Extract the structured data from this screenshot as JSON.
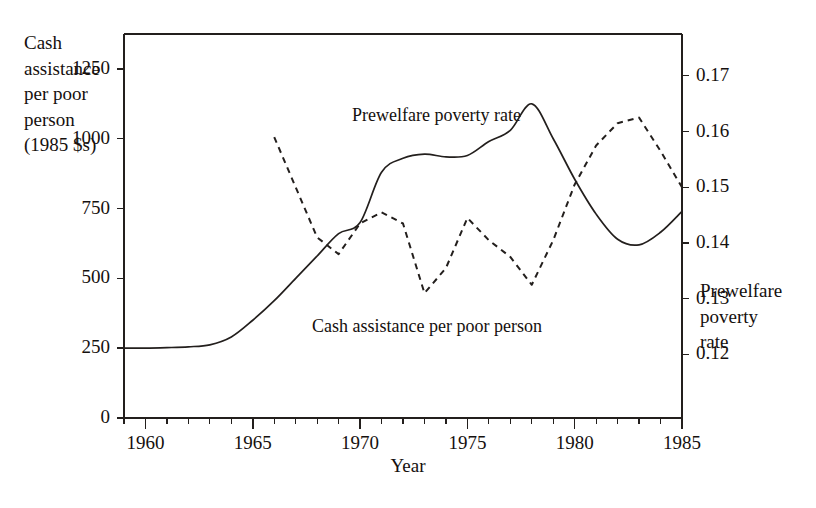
{
  "chart_data": {
    "type": "line",
    "title": "",
    "xlabel": "Year",
    "ylabel": "Cash assistance per poor person (1985 $s)",
    "ylabel_right": "Prewelfare poverty rate",
    "xlim": [
      1959,
      1985
    ],
    "ylim": [
      0,
      1375
    ],
    "ylim_right": [
      0.1086,
      0.1775
    ],
    "grid": false,
    "legend_position": "inline-annotations",
    "xticks_major": [
      1960,
      1965,
      1970,
      1975,
      1980,
      1985
    ],
    "xticks_minor": [
      1959,
      1961,
      1962,
      1963,
      1964,
      1966,
      1967,
      1968,
      1969,
      1971,
      1972,
      1973,
      1974,
      1976,
      1977,
      1978,
      1979,
      1981,
      1982,
      1983,
      1984
    ],
    "yticks_left": [
      0,
      250,
      500,
      750,
      1000,
      1250
    ],
    "yticks_left_labels": [
      "0",
      "250",
      "500",
      "750",
      "1000",
      "1250"
    ],
    "yticks_right": [
      0.12,
      0.13,
      0.14,
      0.15,
      0.16,
      0.17
    ],
    "yticks_right_labels": [
      "0.12",
      "0.13",
      "0.14",
      "0.15",
      "0.16",
      "0.17"
    ],
    "series": [
      {
        "name": "Cash assistance per poor person",
        "axis": "left",
        "style": "solid",
        "color": "#231f1d",
        "x": [
          1959,
          1960,
          1961,
          1962,
          1963,
          1964,
          1965,
          1966,
          1967,
          1968,
          1969,
          1970,
          1971,
          1972,
          1973,
          1974,
          1975,
          1976,
          1977,
          1978,
          1979,
          1980,
          1981,
          1982,
          1983,
          1984,
          1985
        ],
        "values": [
          250,
          250,
          252,
          255,
          262,
          290,
          350,
          420,
          500,
          580,
          660,
          700,
          880,
          930,
          945,
          935,
          940,
          990,
          1030,
          1125,
          1000,
          855,
          730,
          640,
          620,
          665,
          740
        ]
      },
      {
        "name": "Prewelfare poverty rate",
        "axis": "right",
        "style": "dashed",
        "color": "#231f1d",
        "x": [
          1966,
          1967,
          1968,
          1969,
          1970,
          1971,
          1972,
          1973,
          1974,
          1975,
          1976,
          1977,
          1978,
          1979,
          1980,
          1981,
          1982,
          1983,
          1984,
          1985
        ],
        "values": [
          0.159,
          0.15,
          0.141,
          0.138,
          0.1435,
          0.1455,
          0.1435,
          0.131,
          0.1355,
          0.1445,
          0.1405,
          0.1375,
          0.1325,
          0.1405,
          0.1505,
          0.1575,
          0.1615,
          0.1625,
          0.1565,
          0.15
        ]
      }
    ],
    "annotations": [
      {
        "text": "Prewelfare poverty rate",
        "series": "Prewelfare poverty rate"
      },
      {
        "text": "Cash assistance per poor person",
        "series": "Cash assistance per poor person"
      }
    ]
  },
  "labels": {
    "left_axis_title": "Cash\nassistance\nper poor\nperson\n(1985 $s)",
    "right_axis_title": "Prewelfare\npoverty\nrate",
    "x_axis_title": "Year",
    "annotation_prewelfare": "Prewelfare poverty rate",
    "annotation_cash": "Cash assistance per poor person"
  },
  "style": {
    "axis_color": "#231f1d",
    "text_color": "#15100e",
    "background": "#ffffff"
  }
}
